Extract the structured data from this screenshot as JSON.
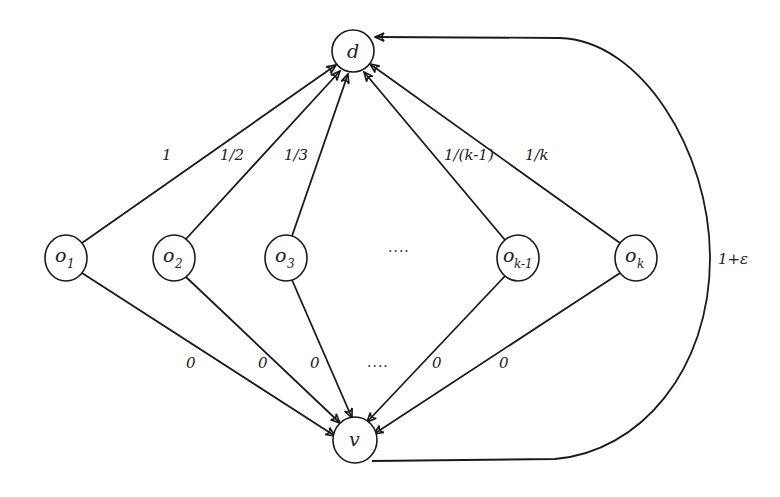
{
  "diagram": {
    "type": "directed-graph",
    "nodes": {
      "d": {
        "label": "d",
        "sub": "",
        "x": 353,
        "y": 51
      },
      "o1": {
        "label": "o",
        "sub": "1",
        "x": 66,
        "y": 258
      },
      "o2": {
        "label": "o",
        "sub": "2",
        "x": 174,
        "y": 258
      },
      "o3": {
        "label": "o",
        "sub": "3",
        "x": 286,
        "y": 258
      },
      "ok1": {
        "label": "o",
        "sub": "k-1",
        "x": 518,
        "y": 258
      },
      "ok": {
        "label": "o",
        "sub": "k",
        "x": 636,
        "y": 258
      },
      "v": {
        "label": "v",
        "sub": "",
        "x": 355,
        "y": 440
      }
    },
    "middle_ellipsis": "....",
    "bottom_ellipsis": "....",
    "edges_to_d": [
      {
        "from": "o1",
        "to": "d",
        "label": "1"
      },
      {
        "from": "o2",
        "to": "d",
        "label": "1/2"
      },
      {
        "from": "o3",
        "to": "d",
        "label": "1/3"
      },
      {
        "from": "ok1",
        "to": "d",
        "label": "1/(k-1)"
      },
      {
        "from": "ok",
        "to": "d",
        "label": "1/k"
      }
    ],
    "edges_to_v": [
      {
        "from": "o1",
        "to": "v",
        "label": "0"
      },
      {
        "from": "o2",
        "to": "v",
        "label": "0"
      },
      {
        "from": "o3",
        "to": "v",
        "label": "0"
      },
      {
        "from": "ok1",
        "to": "v",
        "label": "0"
      },
      {
        "from": "ok",
        "to": "v",
        "label": "0"
      }
    ],
    "edge_v_to_d": {
      "from": "v",
      "to": "d",
      "label": "1+ε"
    }
  }
}
